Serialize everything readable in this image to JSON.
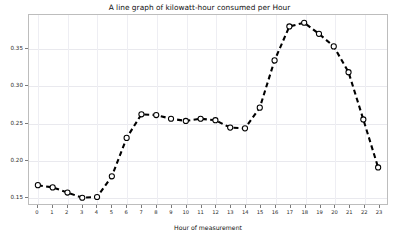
{
  "chart_data": {
    "type": "line",
    "title": "A line graph of kilowatt-hour consumed per Hour",
    "xlabel": "Hour of measurement",
    "ylabel": "Units of kilowatt-hours consumed",
    "x": [
      0,
      1,
      2,
      3,
      4,
      5,
      6,
      7,
      8,
      9,
      10,
      11,
      12,
      13,
      14,
      15,
      16,
      17,
      18,
      19,
      20,
      21,
      22,
      23
    ],
    "values": [
      0.165,
      0.162,
      0.155,
      0.148,
      0.149,
      0.177,
      0.229,
      0.261,
      0.26,
      0.255,
      0.252,
      0.255,
      0.253,
      0.243,
      0.242,
      0.27,
      0.334,
      0.38,
      0.385,
      0.37,
      0.353,
      0.318,
      0.254,
      0.189
    ],
    "xtick_labels": [
      "0",
      "1",
      "2",
      "3",
      "4",
      "5",
      "6",
      "7",
      "8",
      "9",
      "10",
      "11",
      "12",
      "13",
      "14",
      "15",
      "16",
      "17",
      "18",
      "19",
      "20",
      "21",
      "22",
      "23"
    ],
    "ytick_labels": [
      "0.15",
      "0.20",
      "0.25",
      "0.30",
      "0.35"
    ],
    "ytick_values": [
      0.15,
      0.2,
      0.25,
      0.3,
      0.35
    ],
    "xlim": [
      -0.6,
      23.6
    ],
    "ylim": [
      0.1395,
      0.3955
    ],
    "grid": true,
    "legend": "none",
    "line_style": "dashed",
    "line_color": "#000000",
    "marker": "circle-open",
    "marker_face_color": "#ffffff",
    "marker_edge_color": "#000000"
  }
}
